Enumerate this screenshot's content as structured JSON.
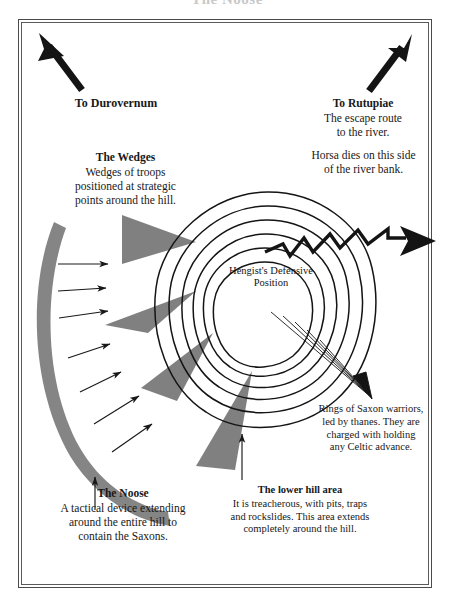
{
  "page": {
    "title": "The Noose"
  },
  "frame": {
    "style": "double-rule-border"
  },
  "colors": {
    "ink": "#181818",
    "troop_gray": "#808080",
    "noose_gray": "#858585",
    "frame": "#4a4a4a",
    "background": "#ffffff"
  },
  "center_label": {
    "line1": "Hengist's",
    "line2": "Defensive",
    "line3": "Position"
  },
  "labels": {
    "durovernum": {
      "heading": "To Durovernum"
    },
    "rutupiae": {
      "heading": "To Rutupiae",
      "line1": "The escape route",
      "line2": "to the river."
    },
    "horsa": {
      "line1": "Horsa dies on this side",
      "line2": "of the river bank."
    },
    "wedges": {
      "heading": "The Wedges",
      "line1": "Wedges of troops",
      "line2": "positioned at strategic",
      "line3": "points around the hill."
    },
    "rings": {
      "line1": "Rings of Saxon warriors,",
      "line2": "led by thanes. They are",
      "line3": "charged with holding",
      "line4": "any Celtic advance."
    },
    "noose": {
      "heading": "The Noose",
      "line1": "A tactical device extending",
      "line2": "around the entire hill to",
      "line3": "contain the Saxons."
    },
    "lower_hill": {
      "heading": "The lower hill area",
      "line1": "It is treacherous, with pits, traps",
      "line2": "and rockslides. This area extends",
      "line3": "completely around the hill."
    }
  },
  "diagram": {
    "ring_count": 6,
    "wedge_count": 4,
    "noose_arrow_count": 7,
    "leader_line_count": 5,
    "escape_route": "zigzag-arrow-east",
    "road_arrows": [
      "northwest-to-durovernum",
      "northeast-to-rutupiae"
    ]
  }
}
